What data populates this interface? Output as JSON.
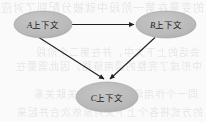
{
  "figure": {
    "type": "directed-graph",
    "background_color": "#fafafa",
    "node_fill_color": "#b9b9b9",
    "node_stroke_color": "#9a9a9a",
    "edge_color": "#1f1f1f",
    "label_color": "#1a1a1a"
  },
  "nodes": [
    {
      "id": "A",
      "label": "A上下文",
      "label_prefix": "A",
      "label_suffix": "上下文",
      "cx": 43,
      "cy": 24.5,
      "rx": 29,
      "ry": 13.5
    },
    {
      "id": "B",
      "label": "B上下文",
      "label_prefix": "B",
      "label_suffix": "上下文",
      "cx": 166,
      "cy": 24.5,
      "rx": 30,
      "ry": 13.5
    },
    {
      "id": "C",
      "label": "C上下文",
      "label_prefix": "C",
      "label_suffix": "上下文",
      "cx": 107,
      "cy": 97,
      "rx": 31,
      "ry": 15
    }
  ],
  "edges": [
    {
      "id": "a-to-b",
      "from": "A",
      "to": "B",
      "x1": 72,
      "y1": 24.5,
      "x2": 134,
      "y2": 24.5,
      "arrow": true
    },
    {
      "id": "a-to-c",
      "from": "A",
      "to": "C",
      "x1": 39,
      "y1": 37.5,
      "x2": 104,
      "y2": 79,
      "arrow": true
    },
    {
      "id": "b-to-c",
      "from": "B",
      "to": "C",
      "x1": 155,
      "y1": 37.5,
      "x2": 110,
      "y2": 79,
      "arrow": true
    }
  ],
  "ghost_text": {
    "note": "faint bleed-through text from reverse side of scanned page",
    "rows": [
      {
        "top": -1,
        "text": "的变量在第一阶段中就被分配到了对应的",
        "size": 11,
        "left": 2
      },
      {
        "top": 44,
        "text": "会话的上下文中，并在第二个阶段",
        "size": 10,
        "left": 6
      },
      {
        "top": 58,
        "text": "中形成了完整的调用链路，因此需要在",
        "size": 10,
        "left": 4
      },
      {
        "top": 86,
        "text": "同一个作用域下重新建立关联关系",
        "size": 10,
        "left": 8
      },
      {
        "top": 104,
        "text": "的方式将各个上下文对象依次合并起来",
        "size": 10,
        "left": 3
      }
    ]
  }
}
